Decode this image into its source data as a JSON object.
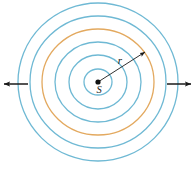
{
  "figure": {
    "name": "concentric-wavefronts-from-point-source",
    "canvas": {
      "width": 195,
      "height": 170
    },
    "background_color": "#ffffff",
    "center": {
      "x": 98,
      "y": 82
    }
  },
  "colors": {
    "wavefront_blue": "#6FB9D4",
    "wavefront_orange": "#E3A95F",
    "arrow_black": "#1a1a1a",
    "label_black": "#1a1a1a",
    "source_dot": "#111111"
  },
  "source": {
    "label": "S",
    "dot_radius": 2.6,
    "dot_x": 98,
    "dot_y": 82,
    "label_x": 99,
    "label_y": 93
  },
  "radius_arrow": {
    "label": "r",
    "label_x": 120,
    "label_y": 64,
    "start_x": 98,
    "start_y": 82,
    "end_x": 145,
    "end_y": 52
  },
  "side_arrows": [
    {
      "name": "left-direction-arrow",
      "from_x": 28,
      "from_y": 84,
      "to_x": 4,
      "to_y": 84
    },
    {
      "name": "right-direction-arrow",
      "from_x": 167,
      "from_y": 84,
      "to_x": 191,
      "to_y": 84
    }
  ],
  "chart_data": {
    "type": "scatter",
    "title": "",
    "subtitle": "",
    "xlabel": "",
    "ylabel": "",
    "annotations": [
      "S",
      "r"
    ],
    "rings": [
      {
        "index": 1,
        "rx": 14,
        "ry": 13,
        "color": "#6FB9D4",
        "stroke_width": 1.3
      },
      {
        "index": 2,
        "rx": 29,
        "ry": 27,
        "color": "#6FB9D4",
        "stroke_width": 1.3
      },
      {
        "index": 3,
        "rx": 43,
        "ry": 40,
        "color": "#6FB9D4",
        "stroke_width": 1.3
      },
      {
        "index": 4,
        "rx": 56,
        "ry": 53,
        "color": "#E3A95F",
        "stroke_width": 1.3
      },
      {
        "index": 5,
        "rx": 68,
        "ry": 66,
        "color": "#6FB9D4",
        "stroke_width": 1.3
      },
      {
        "index": 6,
        "rx": 80,
        "ry": 79,
        "color": "#6FB9D4",
        "stroke_width": 1.3
      }
    ]
  }
}
